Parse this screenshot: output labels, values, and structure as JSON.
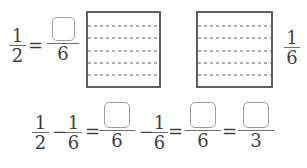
{
  "exercise": "fraction-subtraction-with-grids",
  "colors": {
    "text": "#3d3d3d",
    "square_border": "#5e5e5e",
    "dashed_line": "#aeaeae",
    "box_border": "#9e9e9e",
    "fraction_bar": "#6e6e6e",
    "background": "#ffffff"
  },
  "grids": {
    "count": 2,
    "rows": 6
  },
  "top": {
    "lhs": {
      "num": "1",
      "den": "2"
    },
    "equals": "=",
    "answer": {
      "value": "",
      "den": "6"
    },
    "right_label": {
      "num": "1",
      "den": "6"
    }
  },
  "bottom": {
    "frac_half": {
      "num": "1",
      "den": "2"
    },
    "minus1": "−",
    "frac_sixth1": {
      "num": "1",
      "den": "6"
    },
    "equals1": "=",
    "answer1": {
      "value": "",
      "den": "6"
    },
    "minus2": "−",
    "frac_sixth2": {
      "num": "1",
      "den": "6"
    },
    "equals2": "=",
    "answer2": {
      "value": "",
      "den": "6"
    },
    "equals3": "=",
    "answer3": {
      "value": "",
      "den": "3"
    }
  }
}
